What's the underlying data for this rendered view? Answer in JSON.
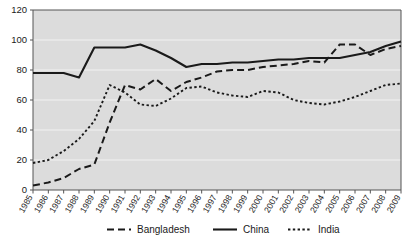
{
  "chart_data": {
    "type": "line",
    "title": "",
    "subtitle": "",
    "xlabel": "",
    "ylabel": "",
    "xlim": [
      1985,
      2009
    ],
    "ylim": [
      0,
      120
    ],
    "yticks": [
      0,
      20,
      40,
      60,
      80,
      100,
      120
    ],
    "grid": true,
    "legend_position": "bottom",
    "plot_background": "#dcdcdc",
    "line_color": "#1a1a1a",
    "categories": [
      "1985",
      "1986",
      "1987",
      "1988",
      "1989",
      "1990",
      "1991",
      "1992",
      "1993",
      "1994",
      "1995",
      "1996",
      "1997",
      "1998",
      "1999",
      "2000",
      "2001",
      "2002",
      "2003",
      "2004",
      "2005",
      "2006",
      "2007",
      "2008",
      "2009"
    ],
    "series": [
      {
        "name": "Bangladesh",
        "style": "long-dash",
        "dasharray": "7,4",
        "values": [
          3,
          5,
          8,
          14,
          17,
          45,
          70,
          67,
          74,
          66,
          72,
          75,
          79,
          80,
          80,
          82,
          83,
          84,
          86,
          85,
          97,
          97,
          90,
          94,
          96
        ]
      },
      {
        "name": "China",
        "style": "solid",
        "dasharray": "none",
        "values": [
          78,
          78,
          78,
          75,
          95,
          95,
          95,
          97,
          93,
          88,
          82,
          84,
          84,
          85,
          85,
          86,
          87,
          87,
          88,
          88,
          88,
          90,
          92,
          96,
          99
        ]
      },
      {
        "name": "India",
        "style": "dotted",
        "dasharray": "2.4,2.4",
        "values": [
          18,
          20,
          26,
          34,
          46,
          70,
          65,
          57,
          56,
          61,
          68,
          69,
          65,
          63,
          62,
          66,
          65,
          60,
          58,
          57,
          59,
          62,
          66,
          70,
          71
        ]
      }
    ]
  },
  "axes": {
    "ytick_labels": [
      "0",
      "20",
      "40",
      "60",
      "80",
      "100",
      "120"
    ],
    "xtick_labels": [
      "1985",
      "1986",
      "1987",
      "1988",
      "1989",
      "1990",
      "1991",
      "1992",
      "1993",
      "1994",
      "1995",
      "1996",
      "1997",
      "1998",
      "1999",
      "2000",
      "2001",
      "2002",
      "2003",
      "2004",
      "2005",
      "2006",
      "2007",
      "2008",
      "2009"
    ]
  },
  "legend": {
    "entries": [
      {
        "label": "Bangladesh",
        "style": "long-dash"
      },
      {
        "label": "China",
        "style": "solid"
      },
      {
        "label": "India",
        "style": "dotted"
      }
    ]
  }
}
